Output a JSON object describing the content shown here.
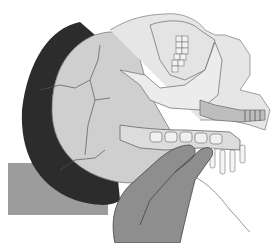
{
  "image": {
    "subject": "medical illustration",
    "description": "Lateral view of a head tilted back, showing skull, jaw, cervical spine and airway, with two fingers palpating the neck; head resting on a pillow",
    "palette": {
      "background": "#ffffff",
      "skull": "#d4d4d4",
      "skull_shadow": "#b8b8b8",
      "pillow_rim": "#2a2a2a",
      "table": "#9a9a9a",
      "hand": "#8a8a8a",
      "bone_highlight": "#efefef",
      "line": "#555555"
    }
  }
}
